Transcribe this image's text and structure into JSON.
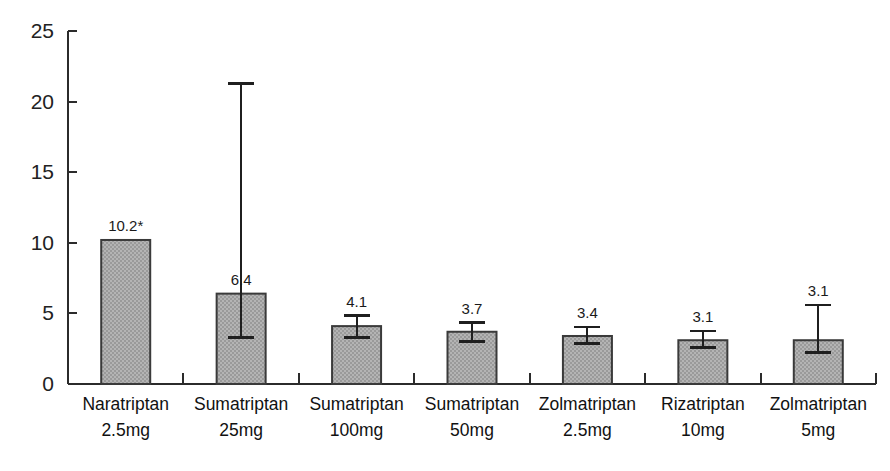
{
  "chart_data": {
    "type": "bar",
    "title": "",
    "subtitle": "",
    "xlabel": "",
    "ylabel": "",
    "ylim": [
      0,
      25
    ],
    "ytick_labels": [
      "0",
      "5",
      "10",
      "15",
      "20",
      "25"
    ],
    "ytick_values": [
      0,
      5,
      10,
      15,
      20,
      25
    ],
    "grid": false,
    "legend": null,
    "categories": [
      "Naratriptan\n2.5mg",
      "Sumatriptan\n25mg",
      "Sumatriptan\n100mg",
      "Sumatriptan\n50mg",
      "Zolmatriptan\n2.5mg",
      "Rizatriptan\n10mg",
      "Zolmatriptan\n5mg"
    ],
    "category_names": [
      "Naratriptan",
      "Sumatriptan",
      "Sumatriptan",
      "Sumatriptan",
      "Zolmatriptan",
      "Rizatriptan",
      "Zolmatriptan"
    ],
    "category_doses": [
      "2.5mg",
      "25mg",
      "100mg",
      "50mg",
      "2.5mg",
      "10mg",
      "5mg"
    ],
    "values": [
      10.2,
      6.4,
      4.1,
      3.7,
      3.4,
      3.1,
      3.1
    ],
    "data_labels": [
      "10.2*",
      "6.4",
      "4.1",
      "3.7",
      "3.4",
      "3.1",
      "3.1"
    ],
    "error_bars": [
      {
        "low": null,
        "high": null
      },
      {
        "low": 3.3,
        "high": 21.3
      },
      {
        "low": 3.3,
        "high": 4.85
      },
      {
        "low": 3.0,
        "high": 4.35
      },
      {
        "low": 2.85,
        "high": 4.05
      },
      {
        "low": 2.6,
        "high": 3.75
      },
      {
        "low": 2.25,
        "high": 5.6
      }
    ],
    "annotations": [
      "* denotes value marked with asterisk on Naratriptan 2.5mg bar"
    ],
    "bar_fill_color": "#a9a9a9",
    "bar_edge_color": "#3a3a3a",
    "axis_color": "#2b2b2b"
  }
}
